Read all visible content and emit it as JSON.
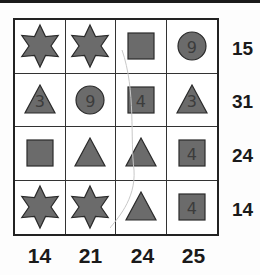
{
  "puzzle": {
    "shape_fill": "#6b6b6b",
    "shape_stroke": "#2a2a2a",
    "rows": [
      {
        "cells": [
          {
            "shape": "star",
            "annotation": ""
          },
          {
            "shape": "star",
            "annotation": ""
          },
          {
            "shape": "square",
            "annotation": ""
          },
          {
            "shape": "circle",
            "annotation": "9"
          }
        ],
        "sum": "15"
      },
      {
        "cells": [
          {
            "shape": "triangle",
            "annotation": "3"
          },
          {
            "shape": "circle",
            "annotation": "9"
          },
          {
            "shape": "square",
            "annotation": "4"
          },
          {
            "shape": "triangle",
            "annotation": "3"
          }
        ],
        "sum": "31"
      },
      {
        "cells": [
          {
            "shape": "square",
            "annotation": ""
          },
          {
            "shape": "triangle",
            "annotation": ""
          },
          {
            "shape": "triangle",
            "annotation": ""
          },
          {
            "shape": "square",
            "annotation": "4"
          }
        ],
        "sum": "24"
      },
      {
        "cells": [
          {
            "shape": "star",
            "annotation": ""
          },
          {
            "shape": "star",
            "annotation": ""
          },
          {
            "shape": "triangle",
            "annotation": ""
          },
          {
            "shape": "square",
            "annotation": "4"
          }
        ],
        "sum": "14"
      }
    ],
    "column_sums": [
      "14",
      "21",
      "24",
      "25"
    ]
  }
}
